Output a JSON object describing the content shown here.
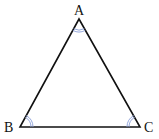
{
  "diagram": {
    "type": "triangle",
    "vertices": [
      {
        "id": "A",
        "label": "A",
        "x": 79,
        "y": 19
      },
      {
        "id": "B",
        "label": "B",
        "x": 20,
        "y": 127
      },
      {
        "id": "C",
        "label": "C",
        "x": 140,
        "y": 127
      }
    ],
    "angle_marks": [
      {
        "vertex": "A",
        "style": "double-arc"
      },
      {
        "vertex": "B",
        "style": "double-arc"
      },
      {
        "vertex": "C",
        "style": "double-arc"
      }
    ],
    "colors": {
      "edge": "#111111",
      "angle_mark": "#8a9fd8"
    }
  }
}
